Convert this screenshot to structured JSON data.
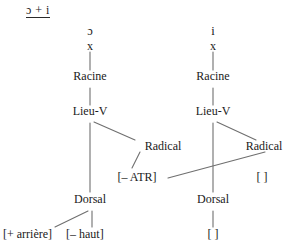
{
  "header": {
    "label": "ɔ + i"
  },
  "diagram": {
    "type": "autosegmental-feature-geometry",
    "trees": [
      {
        "id": "left",
        "segment": "ɔ",
        "skeleton_slot": "x",
        "nodes": {
          "root": "Racine",
          "place": "Lieu-V",
          "radical": "Radical",
          "dorsal": "Dorsal"
        },
        "features": {
          "radical_feature": "[– ATR]",
          "dorsal_features": [
            "[+ arrière]",
            "[– haut]"
          ]
        }
      },
      {
        "id": "right",
        "segment": "i",
        "skeleton_slot": "x",
        "nodes": {
          "root": "Racine",
          "place": "Lieu-V",
          "radical": "Radical",
          "dorsal": "Dorsal"
        },
        "features": {
          "radical_feature": "[    ]",
          "dorsal_features": [
            "[    ]"
          ]
        }
      }
    ],
    "association": {
      "from": "right.radical",
      "to": "left.radical_feature"
    },
    "colors": {
      "line": "#6f6f6f",
      "text": "#1a1a1a",
      "background": "#ffffff"
    }
  }
}
